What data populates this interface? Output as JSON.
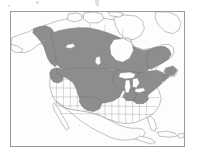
{
  "figure": {
    "kind": "distribution-range-map",
    "region": "North America",
    "frame": {
      "border_color": "#9b9b9b",
      "background_color": "#fdfdfd"
    },
    "palette": {
      "range_fill": "#8d8d8d",
      "range_outline": "#6d6d6d",
      "land_fill": "#fdfdfd",
      "coastline": "#8e8e8e",
      "subdivision_line": "#a8a8a8",
      "page_background": "#ffffff"
    },
    "shaded_range_description": "Grey shaded breeding/distribution range covering Alaska, Yukon, British Columbia, the Canadian prairie provinces, Ontario, Quebec, Labrador and Newfoundland, plus the northern United States from the Pacific Northwest and northern Rockies across the Great Plains and Great Lakes to New England and the mid-Atlantic.",
    "unshaded_description": "Unshaded: Canadian Arctic Archipelago, Greenland margin, the American Southwest, Gulf coast, Florida, Mexico, Central America and the Caribbean.",
    "artifacts": [
      {
        "x": 36,
        "y": 1,
        "w": 3,
        "h": 3
      },
      {
        "x": 95,
        "y": 0,
        "w": 4,
        "h": 4
      },
      {
        "x": 96,
        "y": 4,
        "w": 3,
        "h": 2
      },
      {
        "x": 8,
        "y": 5,
        "w": 2,
        "h": 2
      }
    ]
  },
  "chart_data": {
    "type": "map",
    "title": "",
    "projection": "north-america-conic",
    "legend": [],
    "categories": [
      "range (shaded)",
      "outside range (unshaded)"
    ],
    "values": [
      1,
      0
    ],
    "shaded_regions": [
      "Alaska (interior and south-central)",
      "Yukon",
      "British Columbia",
      "Alberta",
      "Saskatchewan",
      "Manitoba",
      "Ontario",
      "Quebec",
      "Labrador",
      "Newfoundland",
      "New Brunswick",
      "Nova Scotia",
      "Washington",
      "Oregon (north-east)",
      "Idaho",
      "Montana",
      "Wyoming",
      "Colorado (north)",
      "North Dakota",
      "South Dakota",
      "Nebraska",
      "Kansas (north)",
      "Minnesota",
      "Iowa",
      "Wisconsin",
      "Michigan",
      "Illinois (north)",
      "Indiana (north)",
      "Ohio",
      "Pennsylvania",
      "New York",
      "Vermont",
      "New Hampshire",
      "Maine",
      "Massachusetts",
      "Connecticut",
      "Rhode Island",
      "New Jersey",
      "Maryland",
      "West Virginia (north)"
    ],
    "unshaded_regions": [
      "Canadian Arctic Archipelago",
      "Greenland",
      "Nevada",
      "Utah",
      "Arizona",
      "New Mexico",
      "California",
      "Texas",
      "Oklahoma",
      "Arkansas",
      "Louisiana",
      "Mississippi",
      "Alabama",
      "Georgia",
      "Florida",
      "South Carolina",
      "Mexico",
      "Cuba",
      "Central America"
    ]
  }
}
